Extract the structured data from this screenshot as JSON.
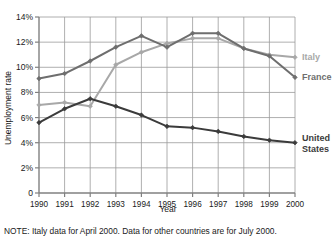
{
  "chart_data": {
    "type": "line",
    "title": "",
    "xlabel": "Year",
    "ylabel": "Unemployment rate",
    "categories": [
      "1990",
      "1991",
      "1992",
      "1993",
      "1994",
      "1995",
      "1996",
      "1997",
      "1998",
      "1999",
      "2000"
    ],
    "x": [
      1990,
      1991,
      1992,
      1993,
      1994,
      1995,
      1996,
      1997,
      1998,
      1999,
      2000
    ],
    "ylim": [
      0,
      14
    ],
    "xlim": [
      1990,
      2000
    ],
    "ytick_labels": [
      "0",
      "2%",
      "4%",
      "6%",
      "8%",
      "10%",
      "12%",
      "14%"
    ],
    "ytick_values": [
      0,
      2,
      4,
      6,
      8,
      10,
      12,
      14
    ],
    "grid": true,
    "legend_position": "right-inline",
    "series": [
      {
        "name": "Italy",
        "color": "#a8a8a8",
        "values": [
          7.0,
          7.2,
          6.9,
          10.2,
          11.2,
          11.9,
          12.3,
          12.3,
          11.5,
          11.0,
          10.8
        ]
      },
      {
        "name": "France",
        "color": "#6e6e6e",
        "values": [
          9.1,
          9.5,
          10.5,
          11.6,
          12.5,
          11.6,
          12.7,
          12.7,
          11.5,
          10.9,
          9.2
        ]
      },
      {
        "name": "United States",
        "color": "#3b3b3b",
        "values": [
          5.6,
          6.7,
          7.5,
          6.9,
          6.2,
          5.3,
          5.2,
          4.9,
          4.5,
          4.2,
          4.0
        ]
      }
    ],
    "annotations": [
      "NOTE: Italy data for April 2000. Data for other countries are for July 2000."
    ]
  },
  "labels": {
    "italy": "Italy",
    "france": "France",
    "united_states_line1": "United",
    "united_states_line2": "States"
  },
  "note": {
    "text": "NOTE: Italy data for April 2000. Data for other countries are for July 2000."
  },
  "axes": {
    "y_title": "Unemployment rate",
    "x_title": "Year"
  },
  "colors": {
    "italy": "#a8a8a8",
    "france": "#6e6e6e",
    "united_states": "#3b3b3b",
    "grid": "#9a9a9a",
    "axis": "#808080",
    "background": "#ffffff"
  }
}
